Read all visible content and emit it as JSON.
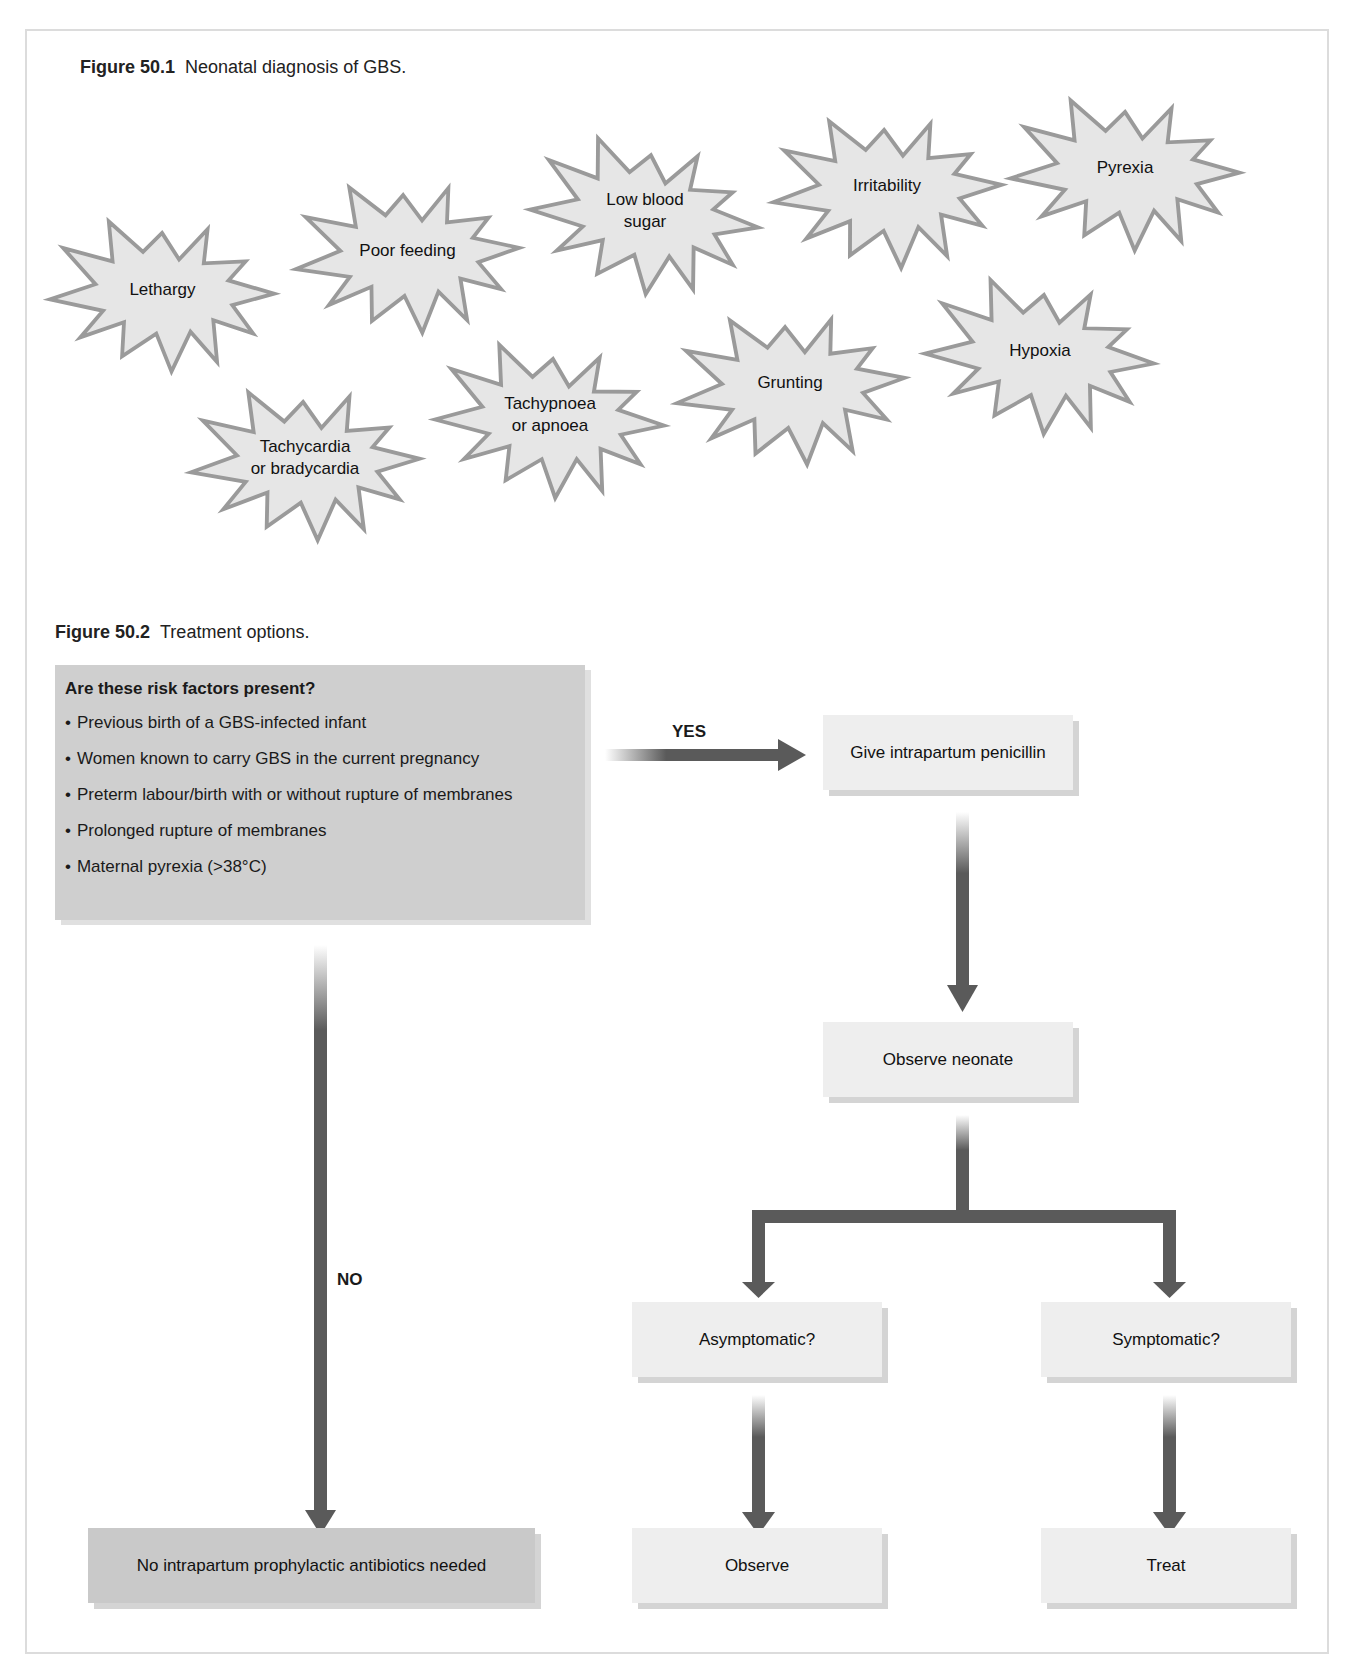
{
  "figure1": {
    "number": "Figure 50.1",
    "caption": "Neonatal diagnosis of GBS.",
    "symptoms": [
      {
        "line1": "Lethargy",
        "line2": ""
      },
      {
        "line1": "Poor feeding",
        "line2": ""
      },
      {
        "line1": "Low blood",
        "line2": "sugar"
      },
      {
        "line1": "Irritability",
        "line2": ""
      },
      {
        "line1": "Pyrexia",
        "line2": ""
      },
      {
        "line1": "Hypoxia",
        "line2": ""
      },
      {
        "line1": "Grunting",
        "line2": ""
      },
      {
        "line1": "Tachypnoea",
        "line2": "or apnoea"
      },
      {
        "line1": "Tachycardia",
        "line2": "or bradycardia"
      }
    ]
  },
  "figure2": {
    "number": "Figure 50.2",
    "caption": "Treatment options.",
    "risk_question": "Are these risk factors present?",
    "risk_factors": [
      "Previous birth of a GBS-infected infant",
      "Women known to carry GBS in the current pregnancy",
      "Preterm labour/birth with or without rupture of membranes",
      "Prolonged rupture of membranes",
      "Maternal pyrexia (>38°C)"
    ],
    "yes_label": "YES",
    "no_label": "NO",
    "nodes": {
      "give_penicillin": "Give intrapartum penicillin",
      "observe_neonate": "Observe neonate",
      "asymptomatic": "Asymptomatic?",
      "symptomatic": "Symptomatic?",
      "observe": "Observe",
      "treat": "Treat",
      "no_antibiotics": "No intrapartum prophylactic antibiotics needed"
    },
    "colors": {
      "arrow": "#5a5a5a",
      "box_light": "#eeeeee",
      "box_dark": "#c9c9c9",
      "risk_box": "#cfcfcf"
    }
  }
}
